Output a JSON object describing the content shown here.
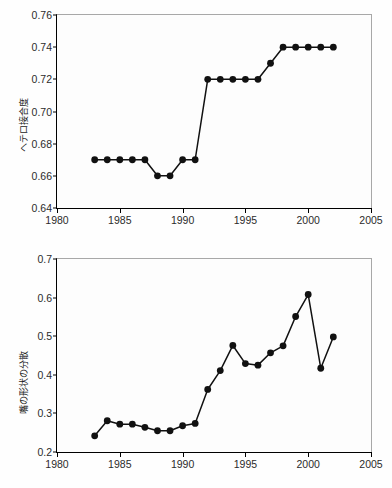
{
  "figure": {
    "panels": [
      {
        "id": "top",
        "ylabel": "ヘテロ接合度",
        "chart_data": {
          "type": "line",
          "title": "",
          "xlabel": "",
          "ylabel": "ヘテロ接合度",
          "xlim": [
            1980,
            2005
          ],
          "ylim": [
            0.64,
            0.76
          ],
          "xticks": [
            1980,
            1985,
            1990,
            1995,
            2000,
            2005
          ],
          "xtick_labels": [
            "1980",
            "1985",
            "1990",
            "1995",
            "2000",
            "2005"
          ],
          "yticks": [
            0.64,
            0.66,
            0.68,
            0.7,
            0.72,
            0.74,
            0.76
          ],
          "ytick_labels": [
            "0.64",
            "0.66",
            "0.68",
            "0.70",
            "0.72",
            "0.74",
            "0.76"
          ],
          "grid": false,
          "legend": "none",
          "marker": "filled-circle",
          "x": [
            1983,
            1984,
            1985,
            1986,
            1987,
            1988,
            1989,
            1990,
            1991,
            1992,
            1993,
            1994,
            1995,
            1996,
            1997,
            1998,
            1999,
            2000,
            2001,
            2002
          ],
          "values": [
            0.67,
            0.67,
            0.67,
            0.67,
            0.67,
            0.66,
            0.66,
            0.67,
            0.67,
            0.72,
            0.72,
            0.72,
            0.72,
            0.72,
            0.73,
            0.74,
            0.74,
            0.74,
            0.74,
            0.74
          ]
        }
      },
      {
        "id": "bottom",
        "ylabel": "嘴の形状の分散",
        "chart_data": {
          "type": "line",
          "title": "",
          "xlabel": "",
          "ylabel": "嘴の形状の分散",
          "xlim": [
            1980,
            2005
          ],
          "ylim": [
            0.2,
            0.7
          ],
          "xticks": [
            1980,
            1985,
            1990,
            1995,
            2000,
            2005
          ],
          "xtick_labels": [
            "1980",
            "1985",
            "1990",
            "1995",
            "2000",
            "2005"
          ],
          "yticks": [
            0.2,
            0.3,
            0.4,
            0.5,
            0.6,
            0.7
          ],
          "ytick_labels": [
            "0.2",
            "0.3",
            "0.4",
            "0.5",
            "0.6",
            "0.7"
          ],
          "grid": false,
          "legend": "none",
          "marker": "filled-circle",
          "x": [
            1983,
            1984,
            1985,
            1986,
            1987,
            1988,
            1989,
            1990,
            1991,
            1992,
            1993,
            1994,
            1995,
            1996,
            1997,
            1998,
            1999,
            2000,
            2001,
            2002
          ],
          "values": [
            0.242,
            0.281,
            0.272,
            0.272,
            0.264,
            0.255,
            0.255,
            0.268,
            0.274,
            0.362,
            0.411,
            0.476,
            0.429,
            0.425,
            0.457,
            0.475,
            0.551,
            0.608,
            0.417,
            0.498
          ]
        }
      }
    ]
  }
}
